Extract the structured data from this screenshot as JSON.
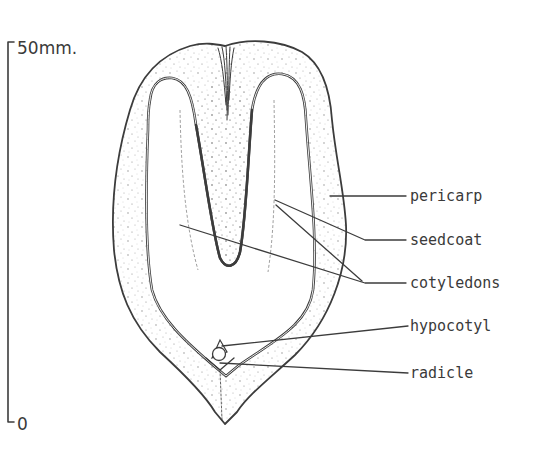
{
  "figure": {
    "ink_color": "#3c3c3c",
    "background": "#ffffff"
  },
  "scale_bar": {
    "top_label": "50mm.",
    "bottom_label": "0"
  },
  "labels": [
    {
      "id": "pericarp",
      "text": "pericarp"
    },
    {
      "id": "seedcoat",
      "text": "seedcoat"
    },
    {
      "id": "cotyledons",
      "text": "cotyledons"
    },
    {
      "id": "hypocotyl",
      "text": "hypocotyl"
    },
    {
      "id": "radicle",
      "text": "radicle"
    }
  ]
}
